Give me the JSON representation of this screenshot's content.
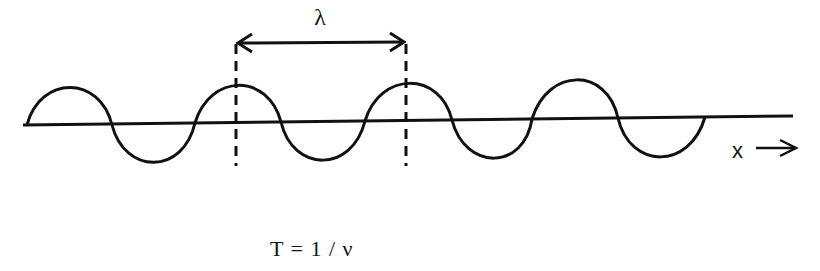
{
  "diagram": {
    "type": "transverse-wave",
    "wavelength_label": "λ",
    "axis_label": "x",
    "formula": "T = 1 / ν",
    "colors": {
      "stroke": "#111111",
      "background": "#ffffff"
    }
  }
}
